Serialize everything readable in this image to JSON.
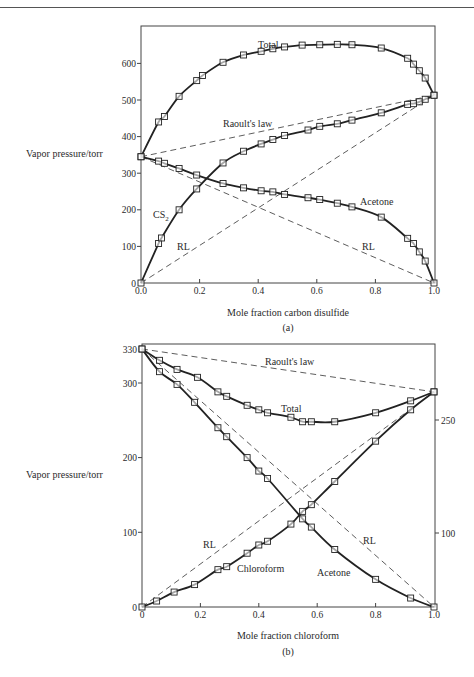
{
  "chart_data": [
    {
      "type": "line",
      "panel_label": "(a)",
      "title": "",
      "xlabel": "Mole fraction carbon disulfide",
      "ylabel": "Vapor pressure/torr",
      "xlim": [
        0,
        1.0
      ],
      "ylim": [
        0,
        700
      ],
      "x_ticks": [
        "0.0",
        "0.2",
        "0.4",
        "0.6",
        "0.8",
        "1.0"
      ],
      "y_ticks": [
        "0",
        "100",
        "200",
        "300",
        "400",
        "500",
        "600"
      ],
      "grid": false,
      "annotations": [
        "Total",
        "Raoult's law",
        "Acetone",
        "CS2",
        "RL",
        "RL"
      ],
      "series": [
        {
          "name": "Total",
          "style": "solid+markers",
          "x": [
            0.0,
            0.06,
            0.08,
            0.13,
            0.19,
            0.21,
            0.28,
            0.35,
            0.41,
            0.45,
            0.49,
            0.55,
            0.61,
            0.67,
            0.72,
            0.82,
            0.91,
            0.93,
            0.95,
            0.97,
            1.0
          ],
          "y": [
            345,
            440,
            455,
            510,
            553,
            567,
            603,
            623,
            633,
            640,
            645,
            650,
            651,
            652,
            651,
            642,
            614,
            598,
            580,
            560,
            513
          ]
        },
        {
          "name": "CS2",
          "style": "solid+markers",
          "x": [
            0.0,
            0.06,
            0.07,
            0.13,
            0.19,
            0.28,
            0.35,
            0.41,
            0.45,
            0.49,
            0.57,
            0.61,
            0.67,
            0.72,
            0.82,
            0.91,
            0.93,
            0.95,
            0.97,
            1.0
          ],
          "y": [
            0,
            108,
            123,
            200,
            257,
            328,
            360,
            380,
            392,
            403,
            418,
            428,
            435,
            445,
            465,
            488,
            490,
            495,
            502,
            513
          ]
        },
        {
          "name": "Acetone",
          "style": "solid+markers",
          "x": [
            0.0,
            0.06,
            0.08,
            0.13,
            0.19,
            0.28,
            0.35,
            0.41,
            0.45,
            0.49,
            0.57,
            0.61,
            0.67,
            0.72,
            0.82,
            0.91,
            0.93,
            0.95,
            0.97,
            1.0
          ],
          "y": [
            345,
            333,
            327,
            313,
            295,
            272,
            260,
            252,
            249,
            242,
            233,
            228,
            218,
            208,
            180,
            122,
            108,
            85,
            60,
            0
          ]
        },
        {
          "name": "Raoult's law (total)",
          "style": "dashed",
          "x": [
            0,
            1
          ],
          "y": [
            345,
            513
          ]
        },
        {
          "name": "RL (CS2)",
          "style": "dashed",
          "x": [
            0,
            1
          ],
          "y": [
            0,
            513
          ]
        },
        {
          "name": "RL (Acetone)",
          "style": "dashed",
          "x": [
            0,
            1
          ],
          "y": [
            345,
            0
          ]
        }
      ]
    },
    {
      "type": "line",
      "panel_label": "(b)",
      "title": "",
      "xlabel": "Mole fraction chloroform",
      "ylabel": "Vapor pressure/torr",
      "xlim": [
        0,
        1.0
      ],
      "ylim": [
        0,
        330
      ],
      "x_ticks": [
        "0",
        "0.2",
        "0.4",
        "0.6",
        "0.8",
        "1.0"
      ],
      "y_ticks": [
        "0",
        "100",
        "200",
        "300",
        "330"
      ],
      "y2_ticks": [
        "100",
        "250"
      ],
      "grid": false,
      "annotations": [
        "Raoult's law",
        "Total",
        "RL",
        "RL",
        "Chloroform",
        "Acetone"
      ],
      "series": [
        {
          "name": "Total",
          "style": "solid+markers",
          "x": [
            0.0,
            0.06,
            0.12,
            0.19,
            0.26,
            0.29,
            0.36,
            0.4,
            0.43,
            0.51,
            0.55,
            0.58,
            0.66,
            0.8,
            0.92,
            1.0
          ],
          "y": [
            330,
            320,
            312,
            305,
            288,
            282,
            270,
            264,
            260,
            254,
            248,
            248,
            248,
            260,
            276,
            288
          ]
        },
        {
          "name": "Acetone",
          "style": "solid+markers",
          "x": [
            0.0,
            0.06,
            0.12,
            0.18,
            0.26,
            0.29,
            0.36,
            0.4,
            0.43,
            0.55,
            0.58,
            0.66,
            0.8,
            0.92,
            1.0
          ],
          "y": [
            330,
            310,
            298,
            274,
            240,
            228,
            200,
            182,
            172,
            118,
            107,
            77,
            37,
            12,
            0
          ]
        },
        {
          "name": "Chloroform",
          "style": "solid+markers",
          "x": [
            0.0,
            0.05,
            0.11,
            0.18,
            0.26,
            0.29,
            0.36,
            0.4,
            0.43,
            0.51,
            0.55,
            0.58,
            0.66,
            0.8,
            0.92,
            1.0
          ],
          "y": [
            0,
            8,
            20,
            30,
            50,
            54,
            72,
            83,
            88,
            111,
            128,
            137,
            168,
            222,
            264,
            288
          ]
        },
        {
          "name": "Raoult's law (total)",
          "style": "dashed",
          "x": [
            0,
            1
          ],
          "y": [
            330,
            288
          ]
        },
        {
          "name": "RL (Chloroform)",
          "style": "dashed",
          "x": [
            0,
            1
          ],
          "y": [
            0,
            288
          ]
        },
        {
          "name": "RL (Acetone)",
          "style": "dashed",
          "x": [
            0,
            1
          ],
          "y": [
            330,
            0
          ]
        }
      ]
    }
  ],
  "labels": {
    "a": {
      "ylabel": "Vapor pressure/torr",
      "xlabel": "Mole fraction carbon disulfide",
      "panel": "(a)",
      "total": "Total",
      "raoult": "Raoult's law",
      "acetone": "Acetone",
      "cs2_main": "CS",
      "cs2_sub": "2",
      "rl_left": "RL",
      "rl_right": "RL",
      "xticks": [
        "0.0",
        "0.2",
        "0.4",
        "0.6",
        "0.8",
        "1.0"
      ],
      "yticks": [
        "0",
        "100",
        "200",
        "300",
        "400",
        "500",
        "600"
      ]
    },
    "b": {
      "ylabel": "Vapor pressure/torr",
      "xlabel": "Mole fraction chloroform",
      "panel": "(b)",
      "total": "Total",
      "raoult": "Raoult's law",
      "acetone": "Acetone",
      "chloroform": "Chloroform",
      "rl_left": "RL",
      "rl_right": "RL",
      "xticks": [
        "0",
        "0.2",
        "0.4",
        "0.6",
        "0.8",
        "1.0"
      ],
      "yticks": [
        "0",
        "100",
        "200",
        "300",
        "330"
      ],
      "y2ticks": [
        "100",
        "250"
      ]
    }
  }
}
